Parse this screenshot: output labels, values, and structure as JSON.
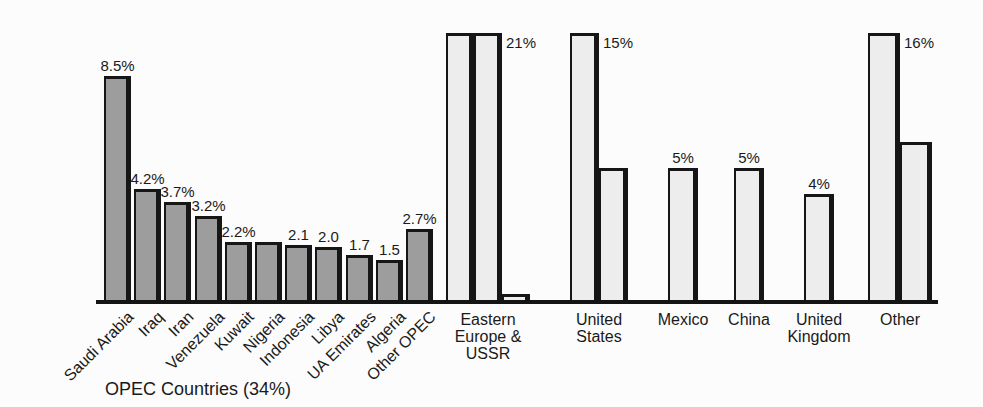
{
  "colors": {
    "opec_bar_fill": "#9d9d9d",
    "non_opec_bar_fill": "#ededed",
    "bar_outline": "#161616",
    "axis": "#141414",
    "background": "#fcfcfc",
    "text": "#1a1a1a"
  },
  "chart_data": {
    "type": "bar",
    "title": "",
    "unit": "percent share of world oil production",
    "layout_hints": {
      "orientation": "vertical",
      "gridlines": false,
      "y_axis_shown": false,
      "baseline_shown": true,
      "tall_bars_clipped_at_top": true,
      "opec_bars_style": "dark gray, slanted category labels",
      "non_opec_bars_style": "light gray, grouped adjacent bars"
    },
    "opec_group": {
      "label": "OPEC Countries (34%)",
      "total_share": "34%",
      "bars": [
        {
          "category": "Saudi Arabia",
          "value": 8.5,
          "value_label": "8.5%"
        },
        {
          "category": "Iraq",
          "value": 4.2,
          "value_label": "4.2%"
        },
        {
          "category": "Iran",
          "value": 3.7,
          "value_label": "3.7%"
        },
        {
          "category": "Venezuela",
          "value": 3.2,
          "value_label": "3.2%"
        },
        {
          "category": "Kuwait",
          "value": 2.2,
          "value_label": "2.2%"
        },
        {
          "category": "Nigeria",
          "value": 2.2,
          "value_label": ""
        },
        {
          "category": "Indonesia",
          "value": 2.1,
          "value_label": "2.1"
        },
        {
          "category": "Libya",
          "value": 2.0,
          "value_label": "2.0"
        },
        {
          "category": "UA Emirates",
          "value": 1.7,
          "value_label": "1.7"
        },
        {
          "category": "Algeria",
          "value": 1.5,
          "value_label": "1.5"
        },
        {
          "category": "Other OPEC",
          "value": 2.7,
          "value_label": "2.7%"
        }
      ]
    },
    "non_opec_groups": [
      {
        "category_lines": [
          "Eastern",
          "Europe &",
          "USSR"
        ],
        "bars": [
          {
            "value": 21,
            "value_label": ""
          },
          {
            "value": 21,
            "value_label": "21%"
          },
          {
            "value": 0.2,
            "value_label": ""
          }
        ]
      },
      {
        "category_lines": [
          "United",
          "States"
        ],
        "bars": [
          {
            "value": 15,
            "value_label": "15%"
          },
          {
            "value": 5,
            "value_label": ""
          }
        ]
      },
      {
        "category_lines": [
          "Mexico"
        ],
        "bars": [
          {
            "value": 5,
            "value_label": "5%"
          }
        ]
      },
      {
        "category_lines": [
          "China"
        ],
        "bars": [
          {
            "value": 5,
            "value_label": "5%"
          }
        ]
      },
      {
        "category_lines": [
          "United",
          "Kingdom"
        ],
        "bars": [
          {
            "value": 4,
            "value_label": "4%"
          }
        ]
      },
      {
        "category_lines": [
          "Other"
        ],
        "bars": [
          {
            "value": 16,
            "value_label": "16%"
          },
          {
            "value": 6,
            "value_label": ""
          }
        ]
      }
    ]
  }
}
